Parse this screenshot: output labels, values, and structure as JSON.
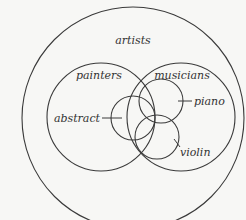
{
  "diagram": {
    "type": "euler-diagram",
    "sets": [
      {
        "id": "artists",
        "label": "artists",
        "cx": 133,
        "cy": 118,
        "r": 111,
        "label_x": 133,
        "label_y": 44
      },
      {
        "id": "painters",
        "label": "painters",
        "cx": 101,
        "cy": 117,
        "r": 54,
        "label_x": 96,
        "label_y": 80
      },
      {
        "id": "musicians",
        "label": "musicians",
        "cx": 181,
        "cy": 117,
        "r": 54,
        "label_x": 181,
        "label_y": 80
      },
      {
        "id": "abstract",
        "label": "abstract",
        "cx": 133,
        "cy": 118,
        "r": 22,
        "label_x": 82,
        "label_y": 122
      },
      {
        "id": "piano",
        "label": "piano",
        "cx": 161,
        "cy": 101,
        "r": 22,
        "label_x": 209,
        "label_y": 105
      },
      {
        "id": "violin",
        "label": "violin",
        "cx": 157,
        "cy": 137,
        "r": 22,
        "label_x": 193,
        "label_y": 154
      }
    ],
    "labels": {
      "artists": "artists",
      "painters": "painters",
      "musicians": "musicians",
      "abstract": "abstract",
      "piano": "piano",
      "violin": "violin"
    }
  }
}
